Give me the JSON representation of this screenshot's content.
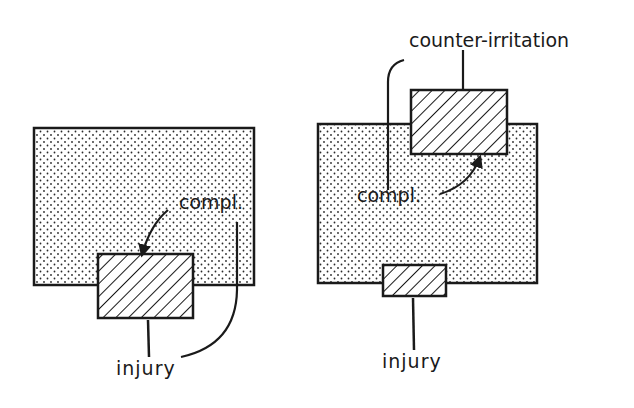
{
  "figure": {
    "panels": [
      {
        "id": "left",
        "labels": {
          "compl": "compl.",
          "injury": "injury"
        },
        "description": "Stippled region with hatched injury box overlapping its bottom edge; arrow from compl. points to injury box"
      },
      {
        "id": "right",
        "labels": {
          "counter_irritation": "counter-irritation",
          "compl": "compl.",
          "injury": "injury"
        },
        "description": "Stippled region with large hatched counter-irritation box at top and small hatched injury box at bottom; arrow from compl. points to counter-irritation box"
      }
    ],
    "colors": {
      "ink": "#1a1a1a",
      "stipple": "#2a2a2a",
      "background": "#ffffff"
    }
  }
}
